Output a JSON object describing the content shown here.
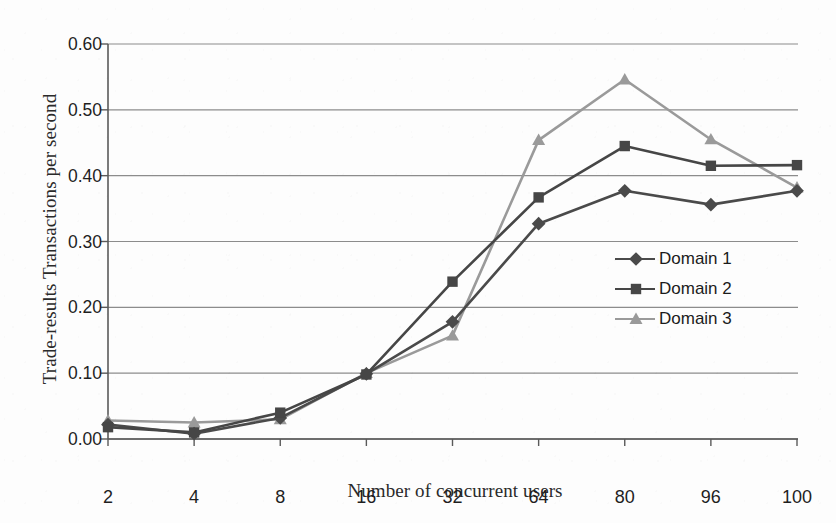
{
  "chart_data": {
    "type": "line",
    "title": "",
    "xlabel": "Number of concurrent users",
    "ylabel": "Trade-results Transactions per second",
    "categories": [
      "2",
      "4",
      "8",
      "16",
      "32",
      "64",
      "80",
      "96",
      "100"
    ],
    "ylim": [
      0.0,
      0.6
    ],
    "ytick_labels": [
      "0.00",
      "0.10",
      "0.20",
      "0.30",
      "0.40",
      "0.50",
      "0.60"
    ],
    "ytick_values": [
      0.0,
      0.1,
      0.2,
      0.3,
      0.4,
      0.5,
      0.6
    ],
    "grid": "horizontal",
    "legend_position": "right-middle",
    "series": [
      {
        "name": "Domain 1",
        "marker": "diamond",
        "color": "#4a4a4a",
        "values": [
          0.022,
          0.008,
          0.032,
          0.099,
          0.178,
          0.327,
          0.377,
          0.356,
          0.377
        ]
      },
      {
        "name": "Domain 2",
        "marker": "square",
        "color": "#464646",
        "values": [
          0.018,
          0.01,
          0.04,
          0.098,
          0.239,
          0.367,
          0.445,
          0.415,
          0.416
        ]
      },
      {
        "name": "Domain 3",
        "marker": "triangle",
        "color": "#9a9a9a",
        "values": [
          0.028,
          0.025,
          0.03,
          0.1,
          0.157,
          0.454,
          0.546,
          0.455,
          0.382
        ]
      }
    ]
  },
  "axis": {
    "y_title": "Trade-results Transactions per second",
    "x_title": "Number of concurrent users"
  },
  "legend": {
    "items": [
      {
        "label": "Domain 1"
      },
      {
        "label": "Domain 2"
      },
      {
        "label": "Domain 3"
      }
    ]
  },
  "colors": {
    "series_1": "#4a4a4a",
    "series_2": "#464646",
    "series_3": "#9a9a9a",
    "grid": "#8c8c8c",
    "axis": "#5a5a5a",
    "text": "#1f1f1f",
    "background": "#fdfdfd"
  }
}
